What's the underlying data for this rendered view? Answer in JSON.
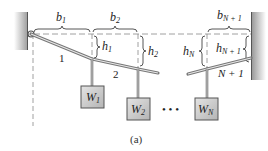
{
  "diagram": {
    "caption": "(a)",
    "spans": [
      {
        "label": "b",
        "sub": "1"
      },
      {
        "label": "b",
        "sub": "2"
      },
      {
        "label": "b",
        "sub": "N + 1"
      }
    ],
    "heights": [
      {
        "label": "h",
        "sub": "1"
      },
      {
        "label": "h",
        "sub": "2"
      },
      {
        "label": "h",
        "sub": "N"
      },
      {
        "label": "h",
        "sub": "N + 1"
      }
    ],
    "segments": [
      "1",
      "2",
      "N + 1"
    ],
    "weights": [
      {
        "label": "W",
        "sub": "1"
      },
      {
        "label": "W",
        "sub": "2"
      },
      {
        "label": "W",
        "sub": "N"
      }
    ],
    "ellipsis": "• • •",
    "colors": {
      "wall": "#8a8a8a",
      "cable": "#9a9a9a",
      "weight_fill": "#c8c8c8",
      "dashed": "#888888"
    }
  }
}
